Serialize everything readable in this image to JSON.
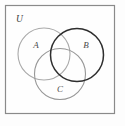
{
  "figure": {
    "background_color": "#fdfdfd"
  },
  "universe": {
    "label": "U",
    "label_x": 16,
    "label_y": 22,
    "frame": {
      "x": 5.5,
      "y": 5.5,
      "width": 109,
      "height": 108,
      "stroke_color": "#8a8a8a",
      "stroke_width": 1.2,
      "fill_color": "#fefefe"
    }
  },
  "sets": [
    {
      "id": "A",
      "label": "A",
      "cx": 44,
      "cy": 54,
      "r": 26,
      "stroke_color": "#a9a9a9",
      "stroke_width": 1.1,
      "label_x": 36,
      "label_y": 48
    },
    {
      "id": "B",
      "label": "B",
      "cx": 77,
      "cy": 55,
      "r": 26.5,
      "stroke_color": "#2e2e2e",
      "stroke_width": 1.5,
      "label_x": 86,
      "label_y": 48
    },
    {
      "id": "C",
      "label": "C",
      "cx": 60,
      "cy": 74,
      "r": 25.5,
      "stroke_color": "#979797",
      "stroke_width": 1.1,
      "label_x": 60,
      "label_y": 92
    }
  ],
  "colors": {
    "frame_stroke": "#8a8a8a",
    "set_a_stroke": "#a9a9a9",
    "set_b_stroke": "#2e2e2e",
    "set_c_stroke": "#979797",
    "label_text": "#4a4a4a",
    "background": "#fdfdfd"
  }
}
